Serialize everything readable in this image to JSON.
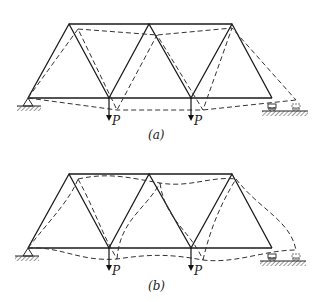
{
  "figure": {
    "panels": [
      {
        "id": "a",
        "caption": "(a)",
        "load_label_1": "P",
        "load_label_2": "P",
        "deflection_style": "piecewise-linear (pin-jointed)"
      },
      {
        "id": "b",
        "caption": "(b)",
        "load_label_1": "P",
        "load_label_2": "P",
        "deflection_style": "curved (rigid-jointed)"
      }
    ],
    "colors": {
      "member": "#1a1a1a",
      "deflected": "#333333",
      "ground_hatch": "#555555"
    }
  }
}
